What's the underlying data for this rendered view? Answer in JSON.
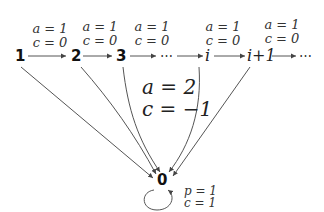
{
  "diagram": {
    "nodes": {
      "n1": "1",
      "n2": "2",
      "n3": "3",
      "ellipsis_mid": "⋯",
      "ni": "i",
      "ni1": "i+1",
      "ellipsis_end": "⋯",
      "n0": "0"
    },
    "edge_labels": {
      "e12": {
        "a": "a = 1",
        "c": "c = 0"
      },
      "e23": {
        "a": "a = 1",
        "c": "c = 0"
      },
      "e3dots": {
        "a": "a = 1",
        "c": "c = 0"
      },
      "edots_i": {
        "a": "a = 1",
        "c": "c = 0"
      },
      "ei_i1": {
        "a": "a = 1",
        "c": "c = 0"
      },
      "to_zero": {
        "a": "a = 2",
        "c": "c = −1"
      },
      "self_loop": {
        "p": "p = 1",
        "c": "c = 1"
      }
    },
    "colors": {
      "edge": "#555555",
      "text": "#222222"
    }
  }
}
